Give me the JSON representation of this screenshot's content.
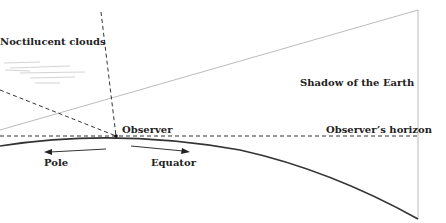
{
  "labels": {
    "noctilucent": "Noctilucent clouds",
    "shadow": "Shadow of the Earth",
    "observer": "Observer",
    "horizon": "Observer’s horizon",
    "pole": "Pole",
    "equator": "Equator"
  },
  "colors": {
    "line": "#333333",
    "light_line": "#bbbbbb",
    "background": "#ffffff"
  }
}
